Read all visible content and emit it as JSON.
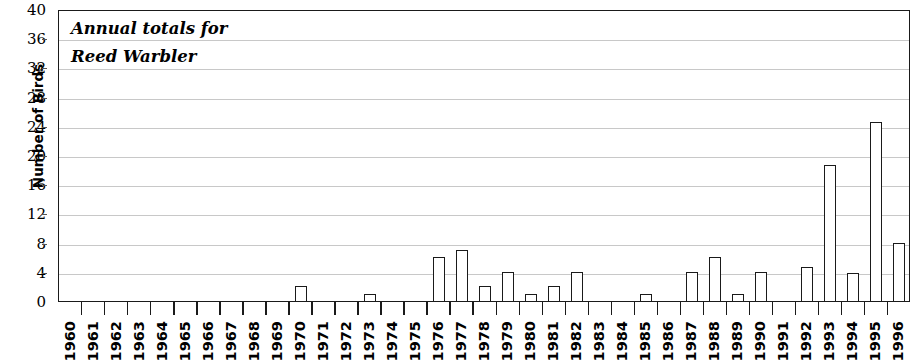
{
  "chart_data": {
    "type": "bar",
    "title": "Annual totals for Reed Warbler",
    "title_lines": [
      "Annual totals for",
      "Reed Warbler"
    ],
    "xlabel": "",
    "ylabel": "Number of Birds",
    "ylim": [
      0,
      40
    ],
    "ytick_step": 4,
    "yticks": [
      0,
      4,
      8,
      12,
      16,
      20,
      24,
      28,
      32,
      36,
      40
    ],
    "ytick_labels": [
      "0",
      "4",
      "8",
      "12",
      "16",
      "20",
      "24",
      "28",
      "32",
      "36",
      "40"
    ],
    "grid": "horizontal",
    "legend": "none",
    "bar_fill": "#ffffff",
    "bar_edge": "#1a1a1a",
    "gridline_color": "#c8c8c8",
    "axis_color": "#1a1a1a",
    "categories": [
      "1960",
      "1961",
      "1962",
      "1963",
      "1964",
      "1965",
      "1966",
      "1967",
      "1968",
      "1969",
      "1970",
      "1971",
      "1972",
      "1973",
      "1974",
      "1975",
      "1976",
      "1977",
      "1978",
      "1979",
      "1980",
      "1981",
      "1982",
      "1983",
      "1984",
      "1985",
      "1986",
      "1987",
      "1988",
      "1989",
      "1990",
      "1991",
      "1992",
      "1993",
      "1994",
      "1995",
      "1996"
    ],
    "values": [
      0,
      0,
      0,
      0,
      0,
      0,
      0,
      0,
      0,
      0,
      2,
      0,
      0,
      1,
      0,
      0,
      6,
      7,
      2,
      4,
      1,
      2,
      4,
      0,
      0,
      1,
      0,
      4,
      6,
      1,
      4,
      0,
      4.7,
      18.7,
      3.8,
      24.5,
      8
    ]
  }
}
